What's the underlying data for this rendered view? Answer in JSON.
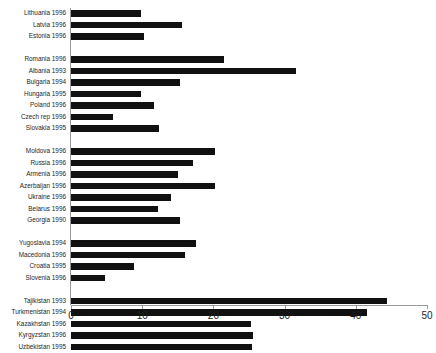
{
  "chart_data": {
    "type": "bar",
    "orientation": "horizontal",
    "title": "",
    "subtitle": "",
    "xlabel": "",
    "ylabel": "",
    "xlim": [
      0,
      50
    ],
    "xticks": [
      0,
      10,
      20,
      30,
      40,
      50
    ],
    "xtick_labels": [
      "0",
      "10",
      "20",
      "30",
      "40",
      "50"
    ],
    "grid": false,
    "legend": null,
    "bar_color": "#111111",
    "axis_color": "#9a9a9a",
    "background": "#ffffff",
    "groups": [
      {
        "name": "baltic",
        "categories": [
          "Lithuania 1996",
          "Latvia 1996",
          "Estonia 1996"
        ],
        "values": [
          9.8,
          15.6,
          10.3
        ]
      },
      {
        "name": "central-eastern-europe",
        "categories": [
          "Romania 1996",
          "Albania 1993",
          "Bulgaria 1994",
          "Hungaria 1995",
          "Poland 1996",
          "Czech rep 1996",
          "Slovakia 1995"
        ],
        "values": [
          21.5,
          31.6,
          15.3,
          9.8,
          11.7,
          5.9,
          12.4
        ]
      },
      {
        "name": "cis-western",
        "categories": [
          "Moldova 1996",
          "Russia 1996",
          "Armenia 1996",
          "Azerbaijan 1996",
          "Ukraine 1996",
          "Belarus 1996",
          "Georgia 1990"
        ],
        "values": [
          20.2,
          17.1,
          15.0,
          20.2,
          14.0,
          12.2,
          15.3
        ]
      },
      {
        "name": "former-yugoslavia",
        "categories": [
          "Yugoslavia 1994",
          "Macedonia 1996",
          "Croatia 1995",
          "Slovenia 1996"
        ],
        "values": [
          17.6,
          16.0,
          8.8,
          4.8
        ]
      },
      {
        "name": "central-asia",
        "categories": [
          "Tajikistan 1993",
          "Turkmenistan 1994",
          "Kazakhstan 1996",
          "Kyrgyzstan 1996",
          "Uzbekistan 1995"
        ],
        "values": [
          44.4,
          41.6,
          25.3,
          25.6,
          25.4
        ]
      }
    ],
    "categories": [
      "Lithuania 1996",
      "Latvia 1996",
      "Estonia 1996",
      "Romania 1996",
      "Albania 1993",
      "Bulgaria 1994",
      "Hungaria 1995",
      "Poland 1996",
      "Czech rep 1996",
      "Slovakia 1995",
      "Moldova 1996",
      "Russia 1996",
      "Armenia 1996",
      "Azerbaijan 1996",
      "Ukraine 1996",
      "Belarus 1996",
      "Georgia 1990",
      "Yugoslavia 1994",
      "Macedonia 1996",
      "Croatia 1995",
      "Slovenia 1996",
      "Tajikistan 1993",
      "Turkmenistan 1994",
      "Kazakhstan 1996",
      "Kyrgyzstan 1996",
      "Uzbekistan 1995"
    ],
    "values": [
      9.8,
      15.6,
      10.3,
      21.5,
      31.6,
      15.3,
      9.8,
      11.7,
      5.9,
      12.4,
      20.2,
      17.1,
      15.0,
      20.2,
      14.0,
      12.2,
      15.3,
      17.6,
      16.0,
      8.8,
      4.8,
      44.4,
      41.6,
      25.3,
      25.6,
      25.4
    ]
  }
}
